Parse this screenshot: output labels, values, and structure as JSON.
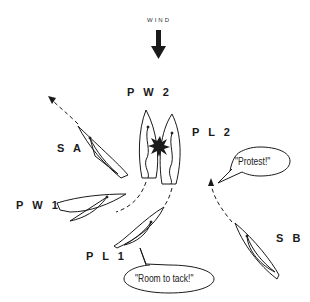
{
  "wind": {
    "label": "WIND",
    "direction": "down"
  },
  "boats": [
    {
      "id": "SA",
      "label": "S A"
    },
    {
      "id": "PW2",
      "label": "P W 2"
    },
    {
      "id": "PL2",
      "label": "P L 2"
    },
    {
      "id": "PW1",
      "label": "P W 1"
    },
    {
      "id": "PL1",
      "label": "P L 1"
    },
    {
      "id": "SB",
      "label": "S B"
    }
  ],
  "speech": {
    "protest": "\"Protest!\"",
    "room": "\"Room to tack!\""
  },
  "colors": {
    "stroke": "#1a1a1a",
    "background": "#ffffff"
  }
}
